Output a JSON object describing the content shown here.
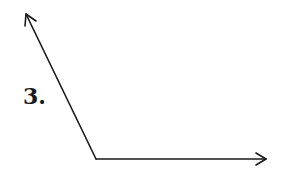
{
  "problem": {
    "number_label": "3."
  },
  "figure": {
    "type": "angle",
    "stroke_color": "#1a1a1a",
    "vertex": [
      96,
      159
    ],
    "ray_1_end": [
      26,
      14
    ],
    "ray_2_end": [
      266,
      159
    ],
    "ray_1_arrow": "arrow-up-left",
    "ray_2_arrow": "arrow-right"
  }
}
